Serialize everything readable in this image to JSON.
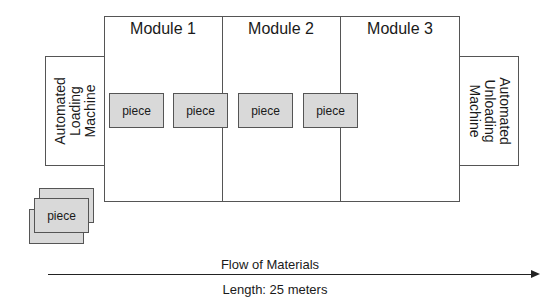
{
  "diagram": {
    "modules": [
      {
        "label": "Module 1"
      },
      {
        "label": "Module 2"
      },
      {
        "label": "Module 3"
      }
    ],
    "loading_machine": {
      "label": "Automated\nLoading\nMachine",
      "lines": [
        "Automated",
        "Loading",
        "Machine"
      ]
    },
    "unloading_machine": {
      "label": "Automated\nUnloading\nMachine",
      "lines": [
        "Automated",
        "Unloading",
        "Machine"
      ]
    },
    "pieces": [
      {
        "label": "piece"
      },
      {
        "label": "piece"
      },
      {
        "label": "piece"
      },
      {
        "label": "piece"
      }
    ],
    "stack_piece": {
      "label": "piece"
    },
    "flow": {
      "label": "Flow of Materials",
      "length_label": "Length: 25 meters"
    },
    "colors": {
      "border": "#555555",
      "piece_fill": "#d9d9d9",
      "background": "#ffffff"
    }
  }
}
